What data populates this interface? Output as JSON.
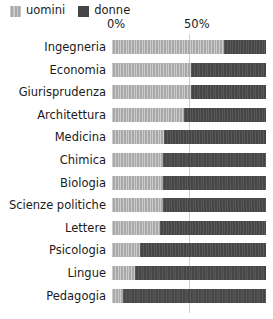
{
  "chart_data": {
    "type": "bar",
    "orientation": "horizontal",
    "stacked": true,
    "normalized_percent": true,
    "title": "",
    "subtitle": "",
    "xlabel": "",
    "ylabel": "",
    "xlim": [
      0,
      100
    ],
    "xticks": [
      0,
      50
    ],
    "xtick_labels": [
      "0%",
      "50%"
    ],
    "grid": "vertical-at-50",
    "legend_position": "top-left",
    "categories": [
      "Ingegneria",
      "Economia",
      "Giurisprudenza",
      "Architettura",
      "Medicina",
      "Chimica",
      "Biologia",
      "Scienze politiche",
      "Lettere",
      "Psicologia",
      "Lingue",
      "Pedagogia"
    ],
    "series": [
      {
        "name": "uomini",
        "color": "#a9a9a9",
        "values": [
          73,
          51,
          51,
          47,
          34,
          33,
          33,
          33,
          31,
          18,
          15,
          7
        ]
      },
      {
        "name": "donne",
        "color": "#464646",
        "values": [
          27,
          49,
          49,
          53,
          66,
          67,
          67,
          67,
          69,
          82,
          85,
          93
        ]
      }
    ]
  },
  "legend": {
    "items": [
      {
        "label": "uomini",
        "swatch": "legend-swatch-men"
      },
      {
        "label": "donne",
        "swatch": "legend-swatch-women"
      }
    ]
  },
  "axis": {
    "tick_0": "0%",
    "tick_50": "50%"
  }
}
